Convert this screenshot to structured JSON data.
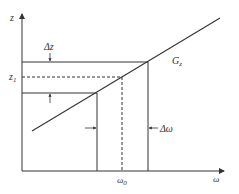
{
  "diagram": {
    "axes": {
      "y_label": "z",
      "x_label": "ω"
    },
    "labels": {
      "delta_z": "Δz",
      "z1_main": "z",
      "z1_sub": "1",
      "gain_main": "G",
      "gain_sub": "z",
      "delta_omega": "Δω",
      "omega0_main": "ω",
      "omega0_sub": "0"
    },
    "colors": {
      "line": "#333333",
      "background": "#ffffff"
    }
  }
}
